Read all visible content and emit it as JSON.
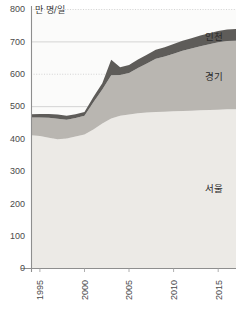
{
  "chart_data": {
    "type": "area",
    "stacked": true,
    "title": "",
    "subtitle": "",
    "xlabel": "",
    "ylabel": "",
    "unit_label": "만 명/일",
    "xlim": [
      1994,
      2017
    ],
    "ylim": [
      0,
      800
    ],
    "ytick_step": 100,
    "yticks": [
      0,
      100,
      200,
      300,
      400,
      500,
      600,
      700,
      800
    ],
    "ytick_labels": [
      "0",
      "100",
      "200",
      "300",
      "400",
      "500",
      "600",
      "700",
      "800"
    ],
    "xticks": [
      1995,
      2000,
      2005,
      2010,
      2015
    ],
    "xtick_labels": [
      "1995",
      "2000",
      "2005",
      "2010",
      "2015"
    ],
    "xtick_rotation": -90,
    "grid": true,
    "grid_axis": "y",
    "legend_position": "inline-right",
    "x": [
      1994,
      1995,
      1996,
      1997,
      1998,
      1999,
      2000,
      2001,
      2002,
      2003,
      2004,
      2005,
      2006,
      2007,
      2008,
      2009,
      2010,
      2011,
      2012,
      2013,
      2014,
      2015,
      2016,
      2017
    ],
    "series": [
      {
        "name": "서울",
        "label": "서울",
        "color": "#eceae6",
        "values": [
          410,
          408,
          402,
          398,
          400,
          406,
          412,
          428,
          446,
          462,
          470,
          474,
          478,
          480,
          482,
          483,
          484,
          485,
          486,
          487,
          488,
          489,
          490,
          490
        ]
      },
      {
        "name": "경기",
        "label": "경기",
        "color": "#b9b6b1",
        "values": [
          55,
          57,
          62,
          63,
          58,
          57,
          58,
          84,
          105,
          133,
          126,
          128,
          140,
          152,
          164,
          170,
          178,
          186,
          192,
          198,
          203,
          208,
          211,
          212
        ]
      },
      {
        "name": "인천",
        "label": "인천",
        "color": "#5e5c59",
        "values": [
          10,
          11,
          12,
          13,
          12,
          12,
          12,
          16,
          20,
          48,
          24,
          25,
          26,
          27,
          28,
          29,
          30,
          31,
          32,
          33,
          34,
          35,
          36,
          36
        ]
      }
    ],
    "series_totals": [
      475,
      476,
      476,
      474,
      470,
      475,
      482,
      528,
      571,
      643,
      620,
      627,
      644,
      659,
      674,
      682,
      692,
      702,
      710,
      718,
      725,
      732,
      737,
      738
    ],
    "colors": {
      "seoul": "#eceae6",
      "gyeonggi": "#b9b6b1",
      "incheon": "#5e5c59",
      "axis": "#8e8e8e",
      "grid_solid": "#c9c9c9",
      "grid_dotted": "#cfcfcf",
      "plot_bg": "#fbfbfa",
      "text": "#3a3a3a"
    }
  }
}
